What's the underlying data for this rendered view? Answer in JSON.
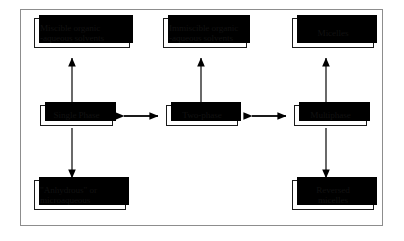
{
  "figure": {
    "frame_color": "#8d8d8d",
    "box_border_color": "#1a1a1a",
    "shadow_color": "#000000",
    "background": "#ffffff"
  },
  "nodes": {
    "miscible": {
      "label": "Miscible organic\n-aqueous solvents",
      "align": "left"
    },
    "immiscible": {
      "label": "Immiscible organic\n-aqueous solvents",
      "align": "left"
    },
    "micelles": {
      "label": "Micelles",
      "align": "center"
    },
    "single_phase": {
      "label": "Single Phase",
      "align": "center"
    },
    "two_phase": {
      "label": "Two-phase",
      "align": "center"
    },
    "multiphase": {
      "label": "Multiphase",
      "align": "center"
    },
    "anhydrous": {
      "label": "\"Anhydrous\" or\nmicroaqueous",
      "align": "left"
    },
    "reversed_micelles": {
      "label": "Reversed\nmicelles",
      "align": "center"
    }
  },
  "connectors": [
    {
      "name": "single-phase-to-miscible",
      "type": "arrow-up"
    },
    {
      "name": "single-phase-to-anhydrous",
      "type": "arrow-down"
    },
    {
      "name": "two-phase-to-immiscible",
      "type": "arrow-up"
    },
    {
      "name": "multiphase-to-micelles",
      "type": "arrow-up"
    },
    {
      "name": "multiphase-to-reversed-micelles",
      "type": "arrow-down"
    },
    {
      "name": "single-phase-two-phase",
      "type": "double-arrow-horizontal"
    },
    {
      "name": "two-phase-multiphase",
      "type": "double-arrow-horizontal"
    }
  ]
}
